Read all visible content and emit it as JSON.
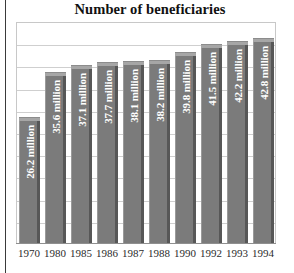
{
  "chart_data": {
    "type": "bar",
    "title": "Number of beneficiaries",
    "xlabel": "",
    "ylabel": "",
    "ylim": [
      0,
      45
    ],
    "grid": true,
    "gridlines": 9,
    "legend": "none",
    "unit": "million",
    "categories": [
      "1970",
      "1980",
      "1985",
      "1986",
      "1987",
      "1988",
      "1990",
      "1992",
      "1993",
      "1994"
    ],
    "values": [
      26.2,
      35.6,
      37.1,
      37.7,
      38.1,
      38.2,
      39.8,
      41.5,
      42.2,
      42.8
    ],
    "data_labels": [
      "26.2 million",
      "35.6 million",
      "37.1 million",
      "37.7 million",
      "38.1 million",
      "38.2 million",
      "39.8 million",
      "41.5 million",
      "42.2 million",
      "42.8 million"
    ],
    "colors": {
      "bar_front": "#7b7b7b",
      "bar_side": "#575757",
      "bar_top": "#a6a6a6",
      "label_text": "#ffffff",
      "grid": "#cfcfcf",
      "frame": "#c8c8c8",
      "title_text": "#111111",
      "axis_text": "#2b2b2b",
      "background": "#ffffff"
    }
  }
}
